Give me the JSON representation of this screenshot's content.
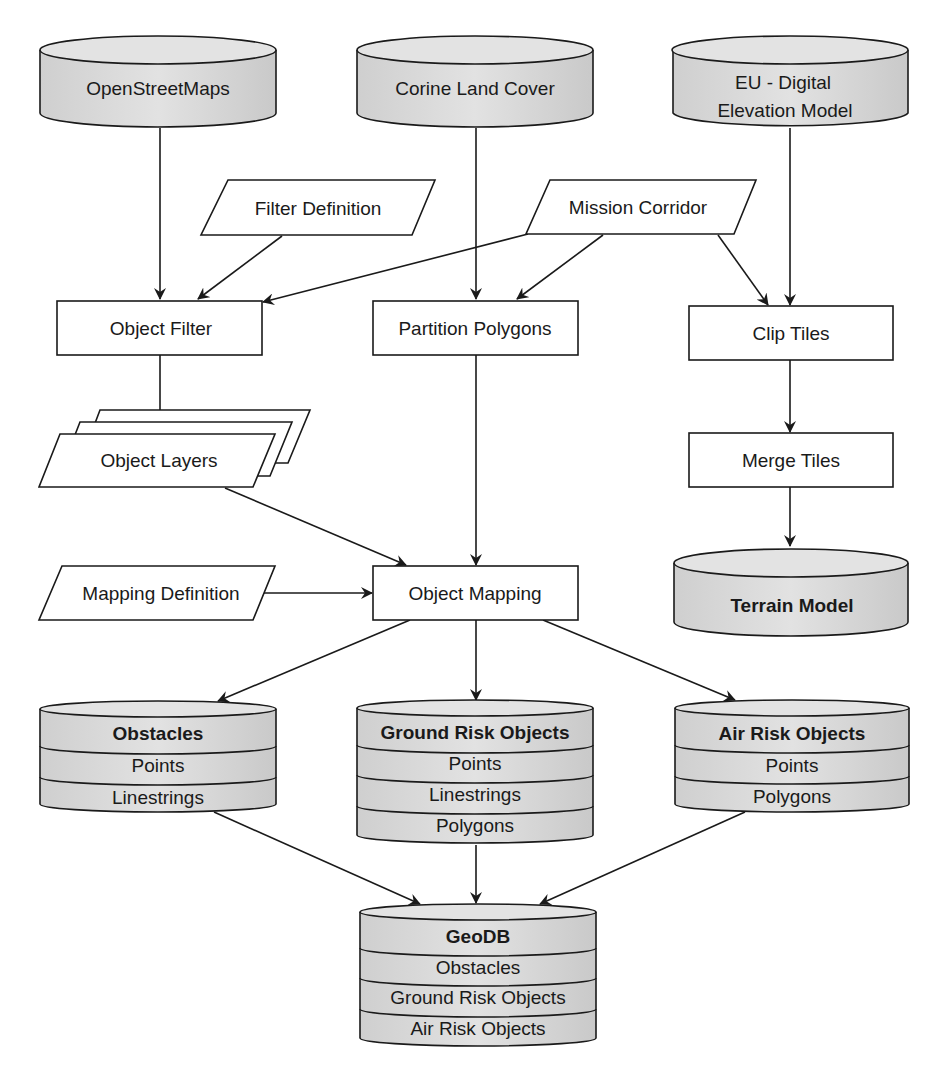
{
  "diagram": {
    "type": "flowchart",
    "colors": {
      "cylinder_fill": "#d9d9d9",
      "cylinder_top": "#e6e6e6",
      "box_fill": "#ffffff",
      "stroke": "#1a1a1a"
    },
    "sources": {
      "osm": "OpenStreetMaps",
      "corine": "Corine Land Cover",
      "eudem_line1": "EU - Digital",
      "eudem_line2": "Elevation Model"
    },
    "inputs": {
      "filter_definition": "Filter Definition",
      "mission_corridor": "Mission Corridor",
      "mapping_definition": "Mapping Definition",
      "object_layers": "Object Layers"
    },
    "processes": {
      "object_filter": "Object Filter",
      "partition_polygons": "Partition Polygons",
      "clip_tiles": "Clip Tiles",
      "merge_tiles": "Merge Tiles",
      "object_mapping": "Object Mapping"
    },
    "stores": {
      "terrain_model": "Terrain Model",
      "obstacles": {
        "title": "Obstacles",
        "rows": [
          "Points",
          "Linestrings"
        ]
      },
      "ground_risk": {
        "title": "Ground Risk Objects",
        "rows": [
          "Points",
          "Linestrings",
          "Polygons"
        ]
      },
      "air_risk": {
        "title": "Air Risk Objects",
        "rows": [
          "Points",
          "Polygons"
        ]
      },
      "geodb": {
        "title": "GeoDB",
        "rows": [
          "Obstacles",
          "Ground Risk Objects",
          "Air Risk Objects"
        ]
      }
    },
    "edges": [
      [
        "OpenStreetMaps",
        "Object Filter"
      ],
      [
        "Filter Definition",
        "Object Filter"
      ],
      [
        "Mission Corridor",
        "Object Filter"
      ],
      [
        "Corine Land Cover",
        "Partition Polygons"
      ],
      [
        "Mission Corridor",
        "Partition Polygons"
      ],
      [
        "Mission Corridor",
        "Clip Tiles"
      ],
      [
        "EU - Digital Elevation Model",
        "Clip Tiles"
      ],
      [
        "Clip Tiles",
        "Merge Tiles"
      ],
      [
        "Merge Tiles",
        "Terrain Model"
      ],
      [
        "Object Filter",
        "Object Layers"
      ],
      [
        "Object Layers",
        "Object Mapping"
      ],
      [
        "Partition Polygons",
        "Object Mapping"
      ],
      [
        "Mapping Definition",
        "Object Mapping"
      ],
      [
        "Object Mapping",
        "Obstacles"
      ],
      [
        "Object Mapping",
        "Ground Risk Objects"
      ],
      [
        "Object Mapping",
        "Air Risk Objects"
      ],
      [
        "Obstacles",
        "GeoDB"
      ],
      [
        "Ground Risk Objects",
        "GeoDB"
      ],
      [
        "Air Risk Objects",
        "GeoDB"
      ]
    ]
  }
}
